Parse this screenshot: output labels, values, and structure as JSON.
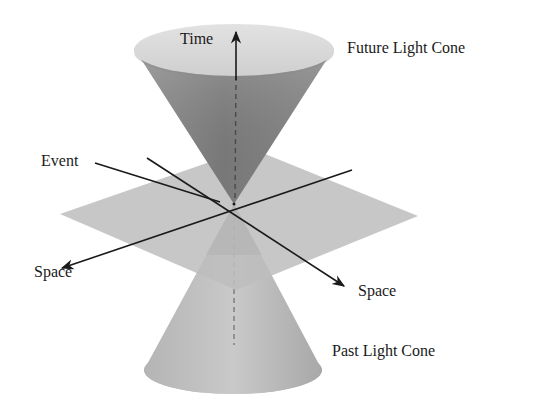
{
  "diagram": {
    "type": "light-cone",
    "labels": {
      "time": "Time",
      "future_cone": "Future Light Cone",
      "event": "Event",
      "space_left": "Space",
      "space_right": "Space",
      "past_cone": "Past Light Cone"
    },
    "colors": {
      "background": "#ffffff",
      "future_cone_rim": "#d4d4d4",
      "future_cone_inner_dark": "#6e6e6e",
      "future_cone_inner_light": "#a8a8a8",
      "plane": "#c4c4c4",
      "past_cone_light": "#c8c8c8",
      "past_cone_dark": "#a4a4a4",
      "lines": "#1a1a1a",
      "dashed_axis": "#777777"
    }
  }
}
